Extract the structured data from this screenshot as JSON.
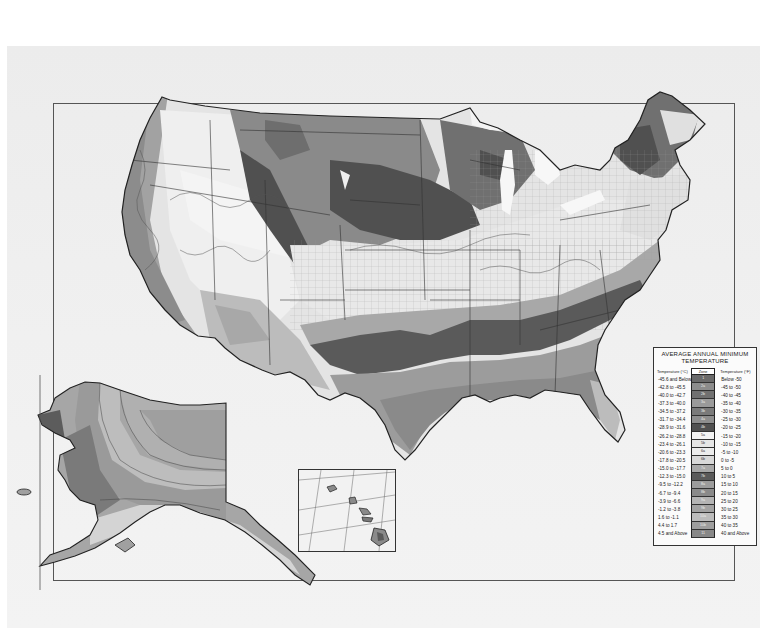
{
  "map": {
    "subject": "USDA Plant Hardiness Zone Map (contiguous United States, Alaska and Hawaii insets)",
    "insets": [
      {
        "name": "Alaska"
      },
      {
        "name": "Hawaii"
      }
    ]
  },
  "legend": {
    "title_line1": "AVERAGE ANNUAL MINIMUM",
    "title_line2": "TEMPERATURE",
    "header_celsius": "Temperature (°C)",
    "header_zone": "Zone",
    "header_fahrenheit": "Temperature (°F)",
    "rows": [
      {
        "celsius": "-45.6 and Below",
        "zone": "1",
        "fahrenheit": "Below -50",
        "color": "#6a6a6a"
      },
      {
        "celsius": "-42.8 to -45.5",
        "zone": "2a",
        "fahrenheit": "-45 to -50",
        "color": "#8c8c8c"
      },
      {
        "celsius": "-40.0 to -42.7",
        "zone": "2b",
        "fahrenheit": "-40 to -45",
        "color": "#707070"
      },
      {
        "celsius": "-37.3 to -40.0",
        "zone": "3a",
        "fahrenheit": "-35 to -40",
        "color": "#9a9a9a"
      },
      {
        "celsius": "-34.5 to -37.2",
        "zone": "3b",
        "fahrenheit": "-30 to -35",
        "color": "#7a7a7a"
      },
      {
        "celsius": "-31.7 to -34.4",
        "zone": "4a",
        "fahrenheit": "-25 to -30",
        "color": "#8e8e8e"
      },
      {
        "celsius": "-28.9 to -31.6",
        "zone": "4b",
        "fahrenheit": "-20 to -25",
        "color": "#505050"
      },
      {
        "celsius": "-26.2 to -28.8",
        "zone": "5a",
        "fahrenheit": "-15 to -20",
        "color": "#f4f4f4"
      },
      {
        "celsius": "-23.4 to -26.1",
        "zone": "5b",
        "fahrenheit": "-10 to -15",
        "color": "#e6e6e6"
      },
      {
        "celsius": "-20.6 to -23.3",
        "zone": "6a",
        "fahrenheit": "-5 to -10",
        "color": "#ececec"
      },
      {
        "celsius": "-17.8 to -20.5",
        "zone": "6b",
        "fahrenheit": "0 to -5",
        "color": "#d8d8d8"
      },
      {
        "celsius": "-15.0 to -17.7",
        "zone": "7a",
        "fahrenheit": "5 to 0",
        "color": "#a8a8a8"
      },
      {
        "celsius": "-12.3 to -15.0",
        "zone": "7b",
        "fahrenheit": "10 to 5",
        "color": "#5a5a5a"
      },
      {
        "celsius": "-9.5 to -12.2",
        "zone": "8a",
        "fahrenheit": "15 to 10",
        "color": "#9c9c9c"
      },
      {
        "celsius": "-6.7 to -9.4",
        "zone": "8b",
        "fahrenheit": "20 to 15",
        "color": "#8a8a8a"
      },
      {
        "celsius": "-3.9 to -6.6",
        "zone": "9a",
        "fahrenheit": "25 to 20",
        "color": "#b4b4b4"
      },
      {
        "celsius": "-1.2 to -3.8",
        "zone": "9b",
        "fahrenheit": "30 to 25",
        "color": "#a2a2a2"
      },
      {
        "celsius": "1.6 to -1.1",
        "zone": "10a",
        "fahrenheit": "35 to 30",
        "color": "#bcbcbc"
      },
      {
        "celsius": "4.4 to 1.7",
        "zone": "10b",
        "fahrenheit": "40 to 35",
        "color": "#9e9e9e"
      },
      {
        "celsius": "4.5 and Above",
        "zone": "11",
        "fahrenheit": "40 and Above",
        "color": "#888888"
      }
    ]
  }
}
